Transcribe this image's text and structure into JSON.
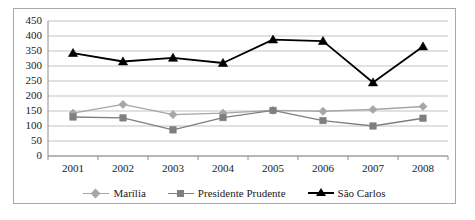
{
  "chart_data": {
    "type": "line",
    "title": "",
    "xlabel": "",
    "ylabel": "",
    "x": [
      "2001",
      "2002",
      "2003",
      "2004",
      "2005",
      "2006",
      "2007",
      "2008"
    ],
    "categories": [
      "2001",
      "2002",
      "2003",
      "2004",
      "2005",
      "2006",
      "2007",
      "2008"
    ],
    "ylim": [
      0,
      450
    ],
    "ytick_step": 50,
    "yticks": [
      450,
      400,
      350,
      300,
      250,
      200,
      150,
      100,
      50,
      0
    ],
    "grid": "horizontal",
    "legend_position": "bottom",
    "series": [
      {
        "name": "Marília",
        "color": "#a6a6a6",
        "marker": "diamond",
        "values": [
          143,
          172,
          138,
          143,
          152,
          149,
          155,
          165
        ]
      },
      {
        "name": "Presidente Prudente",
        "color": "#7f7f7f",
        "marker": "square",
        "values": [
          130,
          127,
          87,
          128,
          152,
          118,
          100,
          126
        ]
      },
      {
        "name": "São Carlos",
        "color": "#000000",
        "marker": "triangle",
        "values": [
          343,
          315,
          327,
          310,
          388,
          383,
          245,
          365
        ]
      }
    ]
  },
  "axis": {
    "y_ticks": [
      "450",
      "400",
      "350",
      "300",
      "250",
      "200",
      "150",
      "100",
      "50",
      "0"
    ],
    "x_ticks": [
      "2001",
      "2002",
      "2003",
      "2004",
      "2005",
      "2006",
      "2007",
      "2008"
    ]
  },
  "legend": {
    "items": [
      {
        "label": "Marília",
        "color": "#a6a6a6",
        "marker": "diamond"
      },
      {
        "label": "Presidente Prudente",
        "color": "#7f7f7f",
        "marker": "square"
      },
      {
        "label": "São Carlos",
        "color": "#000000",
        "marker": "triangle"
      }
    ]
  }
}
